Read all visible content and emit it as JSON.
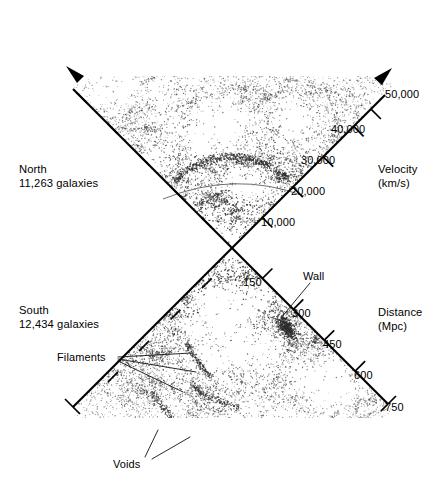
{
  "figure": {
    "background_color": "#ffffff",
    "ink_color": "#000000",
    "dot_color": "#2e2e2e"
  },
  "north": {
    "region_label": "North",
    "count_label": "11,263 galaxies",
    "axis_title_line1": "Velocity",
    "axis_title_line2": "(km/s)",
    "tick_labels": [
      "10,000",
      "20,000",
      "30,000",
      "40,000",
      "50,000"
    ]
  },
  "south": {
    "region_label": "South",
    "count_label": "12,434 galaxies",
    "axis_title_line1": "Distance",
    "axis_title_line2": "(Mpc)",
    "tick_labels": [
      "150",
      "300",
      "450",
      "600",
      "750"
    ]
  },
  "annotations": {
    "wall": "Wall",
    "filaments": "Filaments",
    "voids": "Voids"
  },
  "chart_data": {
    "type": "scatter",
    "subtitle": "Two opposing wedge (pie-slice) projections of galaxy positions",
    "grid": false,
    "legend_position": "none",
    "apex": {
      "x": 232,
      "y": 248
    },
    "panels": [
      {
        "name": "north",
        "label": "North",
        "galaxy_count": 11263,
        "galaxy_count_label": "11,263 galaxies",
        "direction": "up",
        "half_opening_angle_deg": 45,
        "axis": {
          "name": "Velocity",
          "units": "km/s",
          "label": "Velocity (km/s)",
          "range": [
            0,
            50000
          ],
          "ticks": [
            10000,
            20000,
            30000,
            40000,
            50000
          ],
          "tick_labels": [
            "10,000",
            "20,000",
            "30,000",
            "40,000",
            "50,000"
          ],
          "labelled_edge": "right",
          "arrow_terminated": true
        },
        "features": [
          {
            "name": "great-wall-arc",
            "description": "Faint arc of galaxies spanning the cone at roughly 20,000 km/s",
            "radius_kms": 20000
          }
        ]
      },
      {
        "name": "south",
        "label": "South",
        "galaxy_count": 12434,
        "galaxy_count_label": "12,434 galaxies",
        "direction": "down",
        "half_opening_angle_deg": 45,
        "axis": {
          "name": "Distance",
          "units": "Mpc",
          "label": "Distance (Mpc)",
          "range": [
            0,
            750
          ],
          "ticks": [
            150,
            300,
            450,
            600,
            750
          ],
          "tick_labels": [
            "150",
            "300",
            "450",
            "600",
            "750"
          ],
          "labelled_edge": "right",
          "arrow_terminated": false
        },
        "features": [
          {
            "name": "wall",
            "label": "Wall",
            "description": "Dense concentration of galaxies near 300 Mpc on the right edge"
          },
          {
            "name": "filaments",
            "label": "Filaments",
            "description": "Thread-like chains of galaxies in the left-centre of the south cone"
          },
          {
            "name": "voids",
            "label": "Voids",
            "description": "Large empty regions in the lower part of the south cone"
          }
        ]
      }
    ],
    "totals": {
      "galaxies": 23697,
      "galaxies_label": "23,697 galaxies"
    }
  }
}
